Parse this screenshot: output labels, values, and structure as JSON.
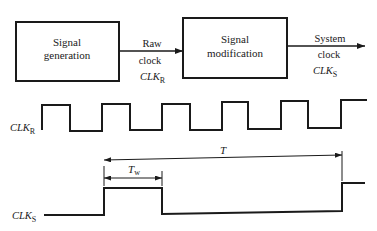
{
  "blocks": [
    {
      "id": "signal-generation",
      "lines": [
        "Signal",
        "generation"
      ]
    },
    {
      "id": "signal-modification",
      "lines": [
        "Signal",
        "modification"
      ]
    }
  ],
  "arrows": [
    {
      "id": "raw-clock",
      "lines": [
        "Raw",
        "clock"
      ],
      "symbol": "CLK",
      "subscript": "R"
    },
    {
      "id": "system-clock",
      "lines": [
        "System",
        "clock"
      ],
      "symbol": "CLK",
      "subscript": "S"
    }
  ],
  "waveforms": {
    "clk_r": {
      "label": "CLK",
      "subscript": "R"
    },
    "clk_s": {
      "label": "CLK",
      "subscript": "S"
    }
  },
  "dimensions": {
    "pulse_width": {
      "label": "T",
      "subscript": "w"
    },
    "period": {
      "label": "T"
    }
  },
  "colors": {
    "ink": "#1a1a1a",
    "background": "#ffffff"
  }
}
